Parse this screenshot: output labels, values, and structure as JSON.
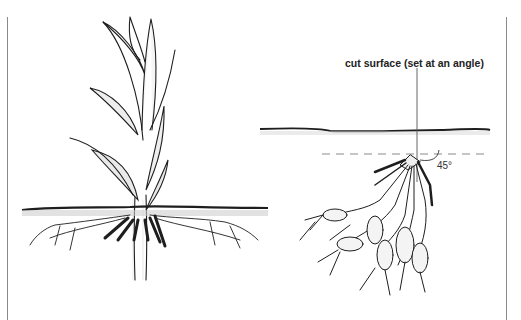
{
  "figure": {
    "panels": [
      {
        "id": "left",
        "subject": "plant-with-shoot-above-soil"
      },
      {
        "id": "right",
        "subject": "root-cluster-cut-and-set-at-angle"
      }
    ],
    "labels": {
      "cut_surface": "cut surface (set at an angle)",
      "angle": "45°"
    },
    "colors": {
      "ink": "#1e1e1e",
      "soil_shade": "#555555",
      "rule": "#8a8a8a",
      "background": "#ffffff"
    }
  }
}
